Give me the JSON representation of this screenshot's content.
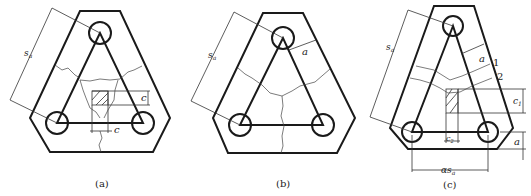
{
  "figure": {
    "panels": [
      {
        "id": "a",
        "caption": "(a)",
        "labels": {
          "spacing": "s",
          "spacing_sub": "a",
          "edge_dim": "c",
          "width_dim": "c"
        }
      },
      {
        "id": "b",
        "caption": "(b)",
        "labels": {
          "spacing": "s",
          "spacing_sub": "a",
          "edge_dist": "a"
        }
      },
      {
        "id": "c",
        "caption": "(c)",
        "labels": {
          "spacing": "s",
          "spacing_sub": "a",
          "edge_dist": "a",
          "crack_1": "1",
          "crack_2": "2",
          "c1": "c",
          "c1_sub": "1",
          "c2": "c",
          "c2_sub": "2",
          "bottom_edge": "a",
          "bottom_spacing": "αs",
          "bottom_spacing_sub": "a"
        }
      }
    ]
  }
}
